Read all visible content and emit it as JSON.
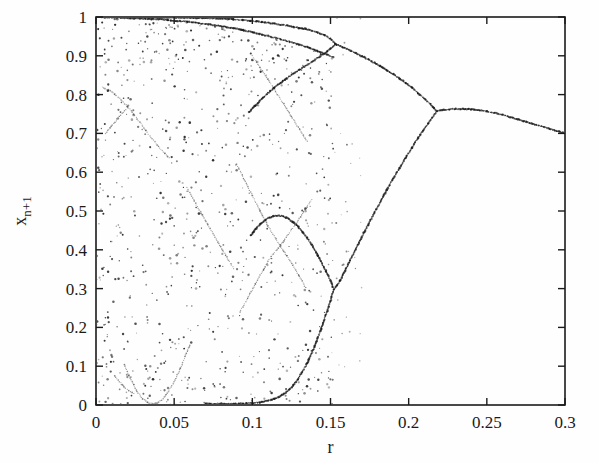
{
  "figure": {
    "background_color": "#fefefe",
    "ink_color": "#1b1b1b",
    "width": 599,
    "height": 463
  },
  "axes": {
    "x_title": "r",
    "y_title_base": "x",
    "y_title_sub": "n+1",
    "x_ticks": [
      "0",
      "0.05",
      "0.1",
      "0.15",
      "0.2",
      "0.25",
      "0.3"
    ],
    "y_ticks": [
      "0",
      "0.1",
      "0.2",
      "0.3",
      "0.4",
      "0.5",
      "0.6",
      "0.7",
      "0.8",
      "0.9",
      "1"
    ]
  },
  "chart_data": {
    "type": "scatter",
    "title": "",
    "xlabel": "r",
    "ylabel": "x_n+1",
    "xlim": [
      0,
      0.3
    ],
    "ylim": [
      0,
      1
    ],
    "xticks": [
      0,
      0.05,
      0.1,
      0.15,
      0.2,
      0.25,
      0.3
    ],
    "yticks": [
      0,
      0.1,
      0.2,
      0.3,
      0.4,
      0.5,
      0.6,
      0.7,
      0.8,
      0.9,
      1.0
    ],
    "grid": false,
    "legend": null,
    "series": [
      {
        "name": "upper-fixed-branch",
        "comment": "single branch from r=0.3 back to merge point at r~0.218",
        "points": [
          [
            0.3,
            0.7
          ],
          [
            0.295,
            0.706
          ],
          [
            0.29,
            0.712
          ],
          [
            0.285,
            0.718
          ],
          [
            0.28,
            0.724
          ],
          [
            0.275,
            0.73
          ],
          [
            0.27,
            0.736
          ],
          [
            0.265,
            0.742
          ],
          [
            0.26,
            0.748
          ],
          [
            0.255,
            0.753
          ],
          [
            0.25,
            0.757
          ],
          [
            0.245,
            0.76
          ],
          [
            0.24,
            0.762
          ],
          [
            0.235,
            0.763
          ],
          [
            0.23,
            0.763
          ],
          [
            0.226,
            0.762
          ],
          [
            0.222,
            0.761
          ],
          [
            0.219,
            0.759
          ]
        ]
      },
      {
        "name": "period2-upper-branch",
        "comment": "upper arm of the period-2 pair, r from 0.218 down to ~0.153",
        "points": [
          [
            0.218,
            0.758
          ],
          [
            0.214,
            0.775
          ],
          [
            0.21,
            0.79
          ],
          [
            0.206,
            0.804
          ],
          [
            0.202,
            0.818
          ],
          [
            0.198,
            0.83
          ],
          [
            0.194,
            0.842
          ],
          [
            0.19,
            0.853
          ],
          [
            0.186,
            0.863
          ],
          [
            0.182,
            0.873
          ],
          [
            0.178,
            0.882
          ],
          [
            0.174,
            0.891
          ],
          [
            0.17,
            0.899
          ],
          [
            0.166,
            0.907
          ],
          [
            0.162,
            0.915
          ],
          [
            0.158,
            0.922
          ],
          [
            0.156,
            0.926
          ],
          [
            0.154,
            0.929
          ],
          [
            0.153,
            0.931
          ]
        ]
      },
      {
        "name": "period2-lower-branch",
        "comment": "lower arm of the period-2 pair, r from 0.218 down to ~0.152",
        "points": [
          [
            0.218,
            0.757
          ],
          [
            0.214,
            0.735
          ],
          [
            0.21,
            0.712
          ],
          [
            0.206,
            0.688
          ],
          [
            0.202,
            0.663
          ],
          [
            0.198,
            0.637
          ],
          [
            0.194,
            0.61
          ],
          [
            0.19,
            0.583
          ],
          [
            0.186,
            0.554
          ],
          [
            0.182,
            0.525
          ],
          [
            0.178,
            0.495
          ],
          [
            0.174,
            0.464
          ],
          [
            0.17,
            0.433
          ],
          [
            0.166,
            0.401
          ],
          [
            0.162,
            0.368
          ],
          [
            0.158,
            0.336
          ],
          [
            0.156,
            0.32
          ],
          [
            0.154,
            0.307
          ],
          [
            0.152,
            0.297
          ]
        ]
      },
      {
        "name": "period4-upper-a",
        "comment": "split of the upper period-2 arm at r~0.153 going up toward 1.0",
        "points": [
          [
            0.153,
            0.932
          ],
          [
            0.15,
            0.944
          ],
          [
            0.146,
            0.953
          ],
          [
            0.142,
            0.96
          ],
          [
            0.138,
            0.965
          ],
          [
            0.134,
            0.969
          ],
          [
            0.13,
            0.972
          ],
          [
            0.126,
            0.975
          ],
          [
            0.122,
            0.978
          ],
          [
            0.118,
            0.98
          ],
          [
            0.114,
            0.983
          ],
          [
            0.11,
            0.985
          ],
          [
            0.106,
            0.987
          ],
          [
            0.1,
            0.99
          ],
          [
            0.094,
            0.992
          ],
          [
            0.088,
            0.994
          ],
          [
            0.08,
            0.996
          ],
          [
            0.07,
            0.997
          ],
          [
            0.06,
            0.998
          ],
          [
            0.05,
            0.999
          ],
          [
            0.04,
            0.999
          ],
          [
            0.03,
            1.0
          ],
          [
            0.02,
            1.0
          ],
          [
            0.012,
            1.0
          ]
        ]
      },
      {
        "name": "period4-upper-b",
        "comment": "split of the upper period-2 arm at r~0.153 going down",
        "points": [
          [
            0.153,
            0.93
          ],
          [
            0.15,
            0.918
          ],
          [
            0.146,
            0.906
          ],
          [
            0.142,
            0.895
          ],
          [
            0.138,
            0.884
          ],
          [
            0.134,
            0.874
          ],
          [
            0.13,
            0.864
          ],
          [
            0.126,
            0.853
          ],
          [
            0.122,
            0.842
          ],
          [
            0.118,
            0.83
          ],
          [
            0.114,
            0.818
          ],
          [
            0.11,
            0.804
          ],
          [
            0.106,
            0.789
          ],
          [
            0.102,
            0.772
          ],
          [
            0.098,
            0.754
          ]
        ]
      },
      {
        "name": "period4-lower-a",
        "comment": "split of the lower period-2 arm at r~0.152 going down to near zero",
        "points": [
          [
            0.152,
            0.296
          ],
          [
            0.15,
            0.268
          ],
          [
            0.147,
            0.232
          ],
          [
            0.144,
            0.196
          ],
          [
            0.141,
            0.163
          ],
          [
            0.138,
            0.133
          ],
          [
            0.135,
            0.107
          ],
          [
            0.132,
            0.085
          ],
          [
            0.129,
            0.066
          ],
          [
            0.126,
            0.05
          ],
          [
            0.122,
            0.034
          ],
          [
            0.118,
            0.023
          ],
          [
            0.114,
            0.016
          ],
          [
            0.11,
            0.011
          ],
          [
            0.105,
            0.007
          ],
          [
            0.1,
            0.005
          ],
          [
            0.094,
            0.004
          ],
          [
            0.088,
            0.003
          ],
          [
            0.08,
            0.003
          ],
          [
            0.07,
            0.003
          ]
        ]
      },
      {
        "name": "period4-lower-b",
        "comment": "split of the lower period-2 arm at r~0.152 going up",
        "points": [
          [
            0.152,
            0.299
          ],
          [
            0.15,
            0.32
          ],
          [
            0.147,
            0.346
          ],
          [
            0.144,
            0.37
          ],
          [
            0.141,
            0.393
          ],
          [
            0.138,
            0.413
          ],
          [
            0.135,
            0.431
          ],
          [
            0.132,
            0.447
          ],
          [
            0.129,
            0.461
          ],
          [
            0.126,
            0.472
          ],
          [
            0.123,
            0.48
          ],
          [
            0.12,
            0.486
          ],
          [
            0.117,
            0.488
          ],
          [
            0.114,
            0.487
          ],
          [
            0.111,
            0.483
          ],
          [
            0.108,
            0.476
          ],
          [
            0.105,
            0.466
          ],
          [
            0.102,
            0.453
          ],
          [
            0.099,
            0.437
          ]
        ]
      },
      {
        "name": "band-edge-upper",
        "comment": "dense upper envelope of the chaotic band from r=0 to r~0.153",
        "points": [
          [
            0.002,
            1.0
          ],
          [
            0.006,
            0.999
          ],
          [
            0.01,
            0.999
          ],
          [
            0.016,
            0.998
          ],
          [
            0.022,
            0.997
          ],
          [
            0.028,
            0.996
          ],
          [
            0.034,
            0.995
          ],
          [
            0.04,
            0.994
          ],
          [
            0.046,
            0.992
          ],
          [
            0.052,
            0.99
          ],
          [
            0.058,
            0.988
          ],
          [
            0.064,
            0.985
          ],
          [
            0.07,
            0.982
          ],
          [
            0.076,
            0.979
          ],
          [
            0.082,
            0.975
          ],
          [
            0.088,
            0.971
          ],
          [
            0.094,
            0.966
          ],
          [
            0.1,
            0.961
          ],
          [
            0.106,
            0.955
          ],
          [
            0.112,
            0.949
          ],
          [
            0.118,
            0.943
          ],
          [
            0.124,
            0.936
          ],
          [
            0.13,
            0.929
          ],
          [
            0.136,
            0.921
          ],
          [
            0.142,
            0.912
          ],
          [
            0.148,
            0.903
          ],
          [
            0.152,
            0.896
          ]
        ]
      },
      {
        "name": "interior-curve-left-descending",
        "comment": "strong interior band curve running from (0.005,0.82) down to (0.045,0.64)",
        "points": [
          [
            0.004,
            0.82
          ],
          [
            0.008,
            0.812
          ],
          [
            0.012,
            0.801
          ],
          [
            0.016,
            0.787
          ],
          [
            0.02,
            0.77
          ],
          [
            0.024,
            0.75
          ],
          [
            0.028,
            0.729
          ],
          [
            0.032,
            0.707
          ],
          [
            0.036,
            0.686
          ],
          [
            0.04,
            0.666
          ],
          [
            0.044,
            0.648
          ],
          [
            0.047,
            0.637
          ]
        ]
      },
      {
        "name": "interior-curve-left-lower",
        "comment": "short curve meeting the descending one near (0.019,0.765)",
        "points": [
          [
            0.006,
            0.7
          ],
          [
            0.009,
            0.714
          ],
          [
            0.012,
            0.729
          ],
          [
            0.015,
            0.744
          ],
          [
            0.018,
            0.758
          ],
          [
            0.02,
            0.766
          ]
        ]
      },
      {
        "name": "interior-u-curve-bottom",
        "comment": "U-shaped curve at the base of the chaotic band, r ~0.018-0.055",
        "points": [
          [
            0.018,
            0.105
          ],
          [
            0.021,
            0.077
          ],
          [
            0.024,
            0.052
          ],
          [
            0.027,
            0.031
          ],
          [
            0.03,
            0.016
          ],
          [
            0.033,
            0.007
          ],
          [
            0.036,
            0.003
          ],
          [
            0.039,
            0.005
          ],
          [
            0.042,
            0.013
          ],
          [
            0.045,
            0.027
          ],
          [
            0.048,
            0.046
          ],
          [
            0.051,
            0.069
          ],
          [
            0.054,
            0.095
          ],
          [
            0.057,
            0.124
          ],
          [
            0.06,
            0.155
          ]
        ]
      },
      {
        "name": "interior-v-tail-left",
        "comment": "small descending tail at r~0.022 into the U",
        "points": [
          [
            0.012,
            0.075
          ],
          [
            0.015,
            0.06
          ],
          [
            0.018,
            0.047
          ],
          [
            0.021,
            0.037
          ],
          [
            0.024,
            0.029
          ]
        ]
      },
      {
        "name": "interior-x-cross-down",
        "comment": "one arm of the X crossing near r~0.118, descending left-to-right",
        "points": [
          [
            0.09,
            0.62
          ],
          [
            0.095,
            0.58
          ],
          [
            0.1,
            0.54
          ],
          [
            0.105,
            0.5
          ],
          [
            0.11,
            0.462
          ],
          [
            0.115,
            0.428
          ],
          [
            0.118,
            0.408
          ],
          [
            0.122,
            0.385
          ],
          [
            0.126,
            0.36
          ],
          [
            0.13,
            0.332
          ],
          [
            0.134,
            0.303
          ]
        ]
      },
      {
        "name": "interior-x-cross-up",
        "comment": "other arm of the X crossing near r~0.118, ascending left-to-right",
        "points": [
          [
            0.092,
            0.24
          ],
          [
            0.097,
            0.275
          ],
          [
            0.102,
            0.312
          ],
          [
            0.107,
            0.348
          ],
          [
            0.112,
            0.383
          ],
          [
            0.118,
            0.412
          ],
          [
            0.123,
            0.44
          ],
          [
            0.128,
            0.468
          ],
          [
            0.133,
            0.498
          ],
          [
            0.138,
            0.53
          ]
        ]
      },
      {
        "name": "interior-diag-midleft",
        "comment": "faint diagonal streak through the band near r 0.06-0.09",
        "points": [
          [
            0.058,
            0.56
          ],
          [
            0.063,
            0.525
          ],
          [
            0.068,
            0.49
          ],
          [
            0.073,
            0.455
          ],
          [
            0.078,
            0.42
          ],
          [
            0.083,
            0.386
          ],
          [
            0.088,
            0.352
          ]
        ]
      },
      {
        "name": "interior-diag-right-upper",
        "comment": "faint curve in upper right of the chaotic band",
        "points": [
          [
            0.1,
            0.9
          ],
          [
            0.105,
            0.87
          ],
          [
            0.11,
            0.84
          ],
          [
            0.115,
            0.808
          ],
          [
            0.12,
            0.776
          ],
          [
            0.125,
            0.744
          ],
          [
            0.13,
            0.712
          ],
          [
            0.135,
            0.68
          ]
        ]
      },
      {
        "name": "chaotic-scatter",
        "comment": "sparse scattered attractor points filling the chaotic band 0 < r < 0.15",
        "density_note": "rendered procedurally from the seeded generator; band occupies 0..1 in x_{n+1}"
      }
    ]
  }
}
